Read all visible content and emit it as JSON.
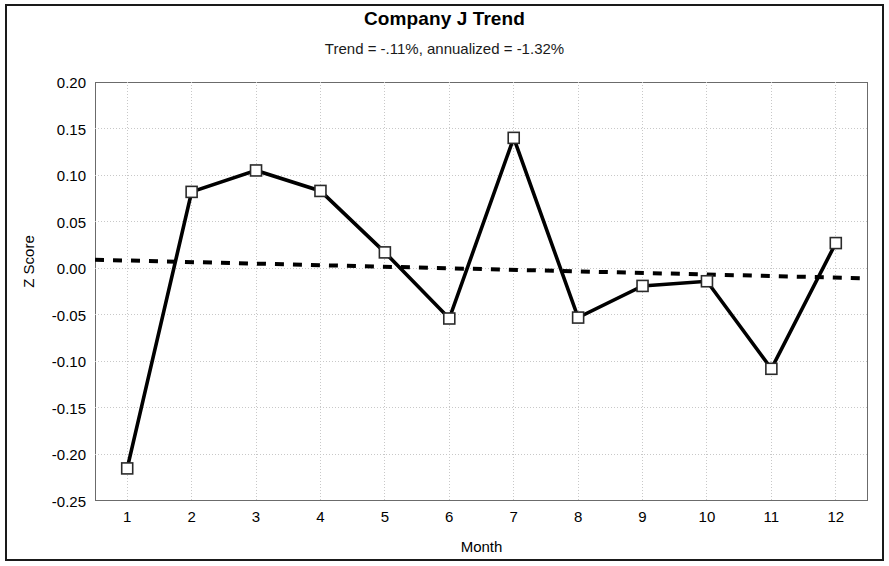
{
  "chart_data": {
    "type": "line",
    "title": "Company J Trend",
    "subtitle": "Trend = -.11%,  annualized = -1.32%",
    "xlabel": "Month",
    "ylabel": "Z Score",
    "xlim": [
      0.5,
      12.5
    ],
    "ylim": [
      -0.25,
      0.2
    ],
    "grid": true,
    "legend": "none",
    "categories": [
      1,
      2,
      3,
      4,
      5,
      6,
      7,
      8,
      9,
      10,
      11,
      12
    ],
    "xticklabels": [
      "1",
      "2",
      "3",
      "4",
      "5",
      "6",
      "7",
      "8",
      "9",
      "10",
      "11",
      "12"
    ],
    "yticks": [
      0.2,
      0.15,
      0.1,
      0.05,
      0.0,
      -0.05,
      -0.1,
      -0.15,
      -0.2,
      -0.25
    ],
    "yticklabels": [
      "0.20",
      "0.15",
      "0.10",
      "0.05",
      "0.00",
      "-0.05",
      "-0.10",
      "-0.15",
      "-0.20",
      "-0.25"
    ],
    "series": [
      {
        "name": "Z Score",
        "style": "solid-line-with-square-markers",
        "color": "#000000",
        "values": [
          -0.215,
          0.082,
          0.105,
          0.083,
          0.017,
          -0.054,
          0.14,
          -0.053,
          -0.019,
          -0.014,
          -0.108,
          0.027
        ]
      },
      {
        "name": "Trend",
        "style": "dotted-line",
        "color": "#000000",
        "values": [
          0.009,
          0.0072,
          0.0054,
          0.0036,
          0.0018,
          0.0,
          -0.0018,
          -0.0036,
          -0.0054,
          -0.0072,
          -0.009,
          -0.0108
        ],
        "endpoints": [
          0.0091,
          -0.0109
        ]
      }
    ]
  },
  "colors": {
    "frame": "#1a1a1a",
    "plot_border": "#6b6b6b",
    "grid": "#c8c8c8",
    "data": "#000000",
    "background": "#ffffff"
  }
}
